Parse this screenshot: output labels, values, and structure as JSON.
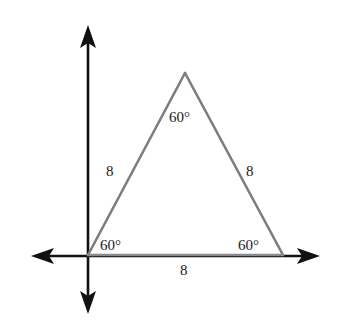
{
  "figure": {
    "title_fragment": "y p",
    "shape": "equilateral-triangle",
    "stroke_color": "#808080",
    "axis_color": "#111111",
    "background": "#ffffff",
    "axes": {
      "vertical": {
        "x": 88,
        "y_top": 27,
        "y_bottom": 312,
        "arrow_top": true,
        "arrow_bottom": true
      },
      "horizontal": {
        "y": 256,
        "x_left": 33,
        "x_right": 318,
        "arrow_left": true,
        "arrow_right": true
      }
    },
    "vertices": {
      "apex": {
        "x": 185,
        "y": 73
      },
      "bottom_left": {
        "x": 88,
        "y": 255
      },
      "bottom_right": {
        "x": 283,
        "y": 255
      }
    },
    "angles": [
      {
        "name": "apex-angle",
        "value": "60°",
        "x": 187,
        "y": 110
      },
      {
        "name": "bottom-left-angle",
        "value": "60°",
        "x": 100,
        "y": 238
      },
      {
        "name": "bottom-right-angle",
        "value": "60°",
        "x": 238,
        "y": 238
      }
    ],
    "sides": [
      {
        "name": "left-side",
        "value": "8",
        "x": 106,
        "y": 164
      },
      {
        "name": "right-side",
        "value": "8",
        "x": 246,
        "y": 164
      },
      {
        "name": "base-side",
        "value": "8",
        "x": 180,
        "y": 263
      }
    ]
  }
}
